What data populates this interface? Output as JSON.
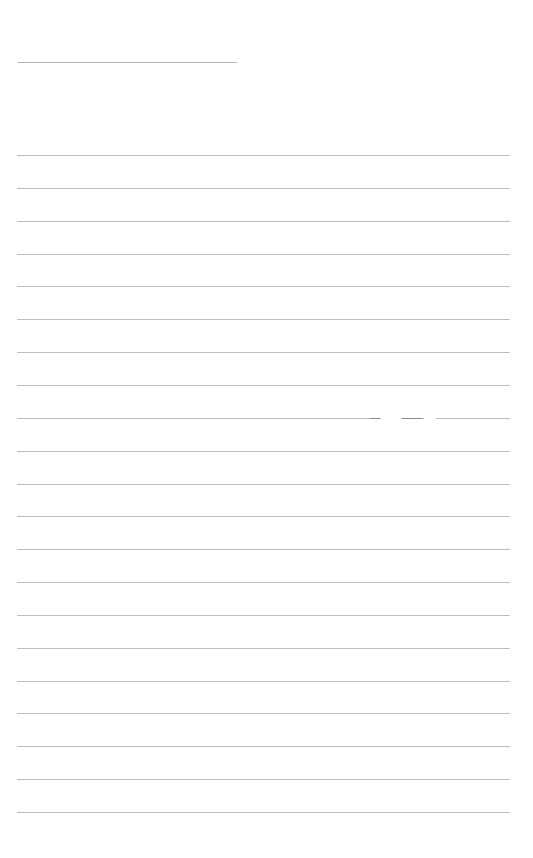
{
  "page": {
    "type": "blank-lined-paper",
    "background": "#ffffff",
    "line_color": "#bdbdbd",
    "title_line": {
      "x": 18,
      "y": 62,
      "width": 219
    },
    "ruled_lines": {
      "count": 21,
      "start_y": 155,
      "spacing": 32.85,
      "x": 17,
      "width": 493
    },
    "text_content": ""
  }
}
